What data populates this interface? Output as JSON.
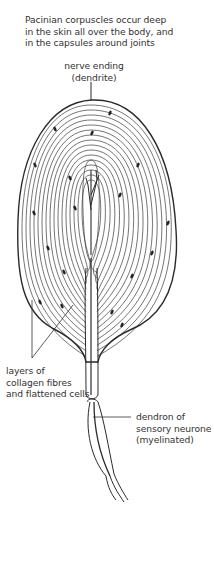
{
  "figure": {
    "caption_lines": [
      "Pacinian corpuscles occur deep",
      "in the skin all over the body, and",
      "in the capsules around joints"
    ],
    "labels": {
      "nerve_ending": [
        "nerve ending",
        "(dendrite)"
      ],
      "layers": [
        "layers of",
        "collagen fibres",
        "and flattened cells"
      ],
      "dendron": [
        "dendron of",
        "sensory neurone",
        "(myelinated)"
      ]
    },
    "colors": {
      "line": "#2a2a2a",
      "text": "#333333",
      "background": "#ffffff"
    }
  }
}
